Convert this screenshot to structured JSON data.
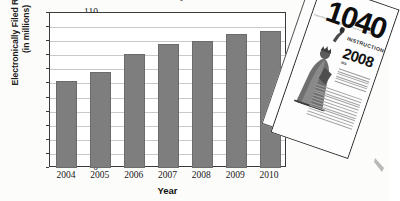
{
  "figure": {
    "title_partial": "Electronically Filed Tax Returns",
    "photo": {
      "form_number": "1040",
      "instructions_label": "INSTRUCTIONS",
      "year": "2008",
      "department_line": "Department of the Treasury  Internal Revenue Service",
      "irs_label": "IRS",
      "statue_icon": "statue-of-liberty-icon"
    }
  },
  "chart_data": {
    "type": "bar",
    "title": "Electronically Filed Tax Returns",
    "categories": [
      "2004",
      "2005",
      "2006",
      "2007",
      "2008",
      "2009",
      "2010"
    ],
    "values": [
      62,
      68,
      81,
      88,
      90,
      95,
      97
    ],
    "series": [
      {
        "name": "Electronically Filed Returns (in millions)",
        "values": [
          62,
          68,
          81,
          88,
          90,
          95,
          97
        ]
      }
    ],
    "xlabel": "Year",
    "ylabel": "Electronically Filed Returns",
    "ylabel_line1": "Electronically Filed Returns",
    "ylabel_line2": "(in millions)",
    "ylim": [
      0,
      110
    ],
    "ytick_step": 10,
    "yticks": [
      0,
      10,
      20,
      30,
      40,
      50,
      60,
      70,
      80,
      90,
      100,
      110
    ],
    "ytick_labels": [
      "0",
      "10",
      "20",
      "30",
      "40",
      "50",
      "60",
      "70",
      "80",
      "90",
      "100",
      "110"
    ],
    "grid": true,
    "grid_axis": "y",
    "legend": false,
    "bar_color": "#7e7e7e",
    "axis_color": "#3a3a3a",
    "gridline_color": "#c9c9c9",
    "plot_background": "#ffffff"
  }
}
